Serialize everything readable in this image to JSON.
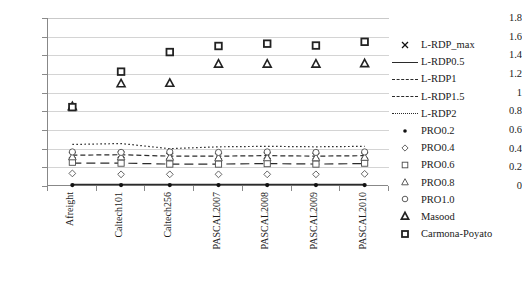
{
  "chart_data": {
    "type": "line",
    "title": "",
    "subtitle": "",
    "xlabel": "",
    "ylabel": "",
    "grid": true,
    "legend_position": "right",
    "ylim": [
      0,
      1.8
    ],
    "yticks": [
      "0",
      "0.2",
      "0.4",
      "0.6",
      "0.8",
      "1",
      "1.2",
      "1.4",
      "1.6",
      "1.8"
    ],
    "ytick_values": [
      0,
      0.2,
      0.4,
      0.6,
      0.8,
      1.0,
      1.2,
      1.4,
      1.6,
      1.8
    ],
    "categories": [
      "Afreight",
      "Caltech101",
      "Caltech256",
      "PASCAL2007",
      "PASCAL2008",
      "PASCAL2009",
      "PASCAL2010"
    ],
    "series": [
      {
        "name": "L-RDP_max",
        "marker": "x-cross",
        "style": "markers",
        "values": [
          0.33,
          0.335,
          0.32,
          0.32,
          0.325,
          0.32,
          0.325
        ]
      },
      {
        "name": "L-RDP0.5",
        "marker": "none",
        "style": "solid",
        "values": [
          0.015,
          0.015,
          0.015,
          0.015,
          0.015,
          0.015,
          0.015
        ]
      },
      {
        "name": "L-RDP1",
        "marker": "none",
        "style": "dashed",
        "values": [
          0.245,
          0.245,
          0.235,
          0.235,
          0.24,
          0.235,
          0.24
        ]
      },
      {
        "name": "L-RDP1.5",
        "marker": "none",
        "style": "dashdot",
        "values": [
          0.33,
          0.335,
          0.32,
          0.32,
          0.325,
          0.32,
          0.325
        ]
      },
      {
        "name": "L-RDP2",
        "marker": "none",
        "style": "dotted",
        "values": [
          0.445,
          0.455,
          0.4,
          0.42,
          0.425,
          0.42,
          0.425
        ]
      },
      {
        "name": "PRO0.2",
        "marker": "filled-dot",
        "style": "markers",
        "values": [
          0.01,
          0.01,
          0.01,
          0.01,
          0.01,
          0.01,
          0.01
        ]
      },
      {
        "name": "PRO0.4",
        "marker": "open-diamond",
        "style": "markers",
        "values": [
          0.135,
          0.125,
          0.125,
          0.125,
          0.125,
          0.125,
          0.13
        ]
      },
      {
        "name": "PRO0.6",
        "marker": "open-square",
        "style": "markers",
        "values": [
          0.255,
          0.245,
          0.235,
          0.235,
          0.24,
          0.235,
          0.245
        ]
      },
      {
        "name": "PRO0.8",
        "marker": "open-triangle",
        "style": "markers",
        "values": [
          0.315,
          0.315,
          0.31,
          0.305,
          0.305,
          0.305,
          0.31
        ]
      },
      {
        "name": "PRO1.0",
        "marker": "open-circle",
        "style": "markers",
        "values": [
          0.365,
          0.36,
          0.365,
          0.36,
          0.365,
          0.36,
          0.365
        ]
      },
      {
        "name": "Masood",
        "marker": "filled-tri",
        "style": "markers",
        "values": [
          0.855,
          1.1,
          1.105,
          1.31,
          1.31,
          1.31,
          1.315
        ]
      },
      {
        "name": "Carmona-Poyato",
        "marker": "filled-square",
        "style": "markers",
        "values": [
          0.845,
          1.225,
          1.435,
          1.5,
          1.525,
          1.505,
          1.545
        ]
      }
    ]
  },
  "legend": {
    "items": [
      {
        "label": "L-RDP_max",
        "key": "x-cross"
      },
      {
        "label": "L-RDP0.5",
        "key": "solid-line"
      },
      {
        "label": "L-RDP1",
        "key": "dashed-line"
      },
      {
        "label": "L-RDP1.5",
        "key": "dashdot-line"
      },
      {
        "label": "L-RDP2",
        "key": "dotted-line"
      },
      {
        "label": "PRO0.2",
        "key": "filled-dot"
      },
      {
        "label": "PRO0.4",
        "key": "open-diamond"
      },
      {
        "label": "PRO0.6",
        "key": "open-square"
      },
      {
        "label": "PRO0.8",
        "key": "open-triangle"
      },
      {
        "label": "PRO1.0",
        "key": "open-circle"
      },
      {
        "label": "Masood",
        "key": "filled-triangle"
      },
      {
        "label": "Carmona-Poyato",
        "key": "filled-square"
      }
    ]
  },
  "colors": {
    "axis": "#888888",
    "grid": "#d4d4d4",
    "ink": "#1a1a1a",
    "background": "#ffffff"
  }
}
